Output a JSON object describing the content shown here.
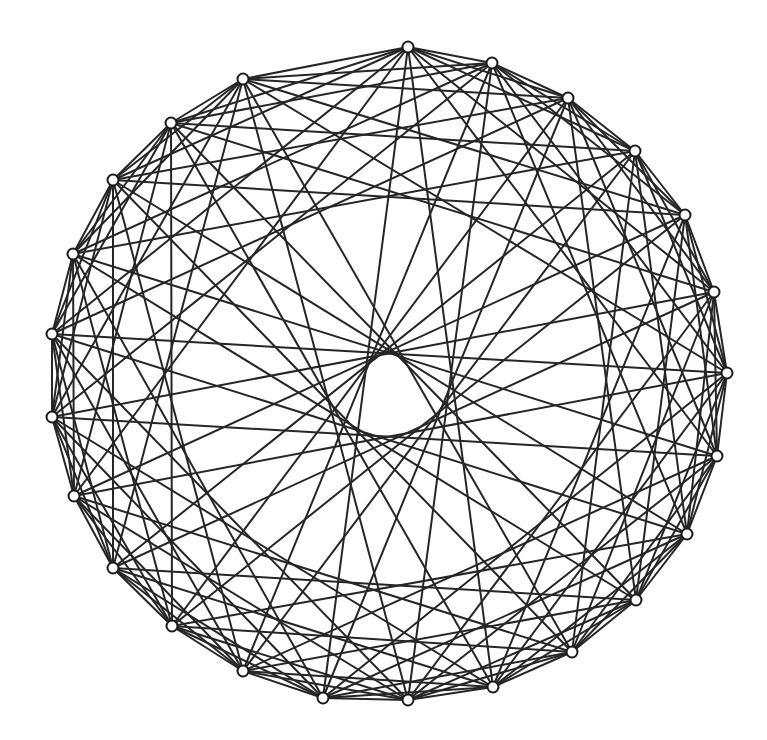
{
  "figure": {
    "kind": "circulant-graph-diagram",
    "title": "",
    "width": 767,
    "height": 740,
    "background_color": "#ffffff",
    "edge_color": "#262626",
    "edge_width": 2.0,
    "node_fill_color": "#ffffff",
    "node_stroke_color": "#1a1a1a",
    "node_stroke_width": 2.0,
    "node_radius": 5.5
  },
  "chart_data": {
    "type": "scatter",
    "title": "",
    "subtitle": "",
    "xlabel": "",
    "ylabel": "",
    "legend": [],
    "grid": false,
    "xlim": [
      0,
      767
    ],
    "ylim": [
      0,
      740
    ],
    "layout": "circular",
    "node_count": 24,
    "center": [
      390,
      375
    ],
    "radius_x": 338,
    "radius_y": 328,
    "inner_hole_radius": 22,
    "connection_offsets": [
      1,
      2,
      3,
      5,
      7,
      11
    ],
    "nodes": [
      {
        "id": 0,
        "label": "n0",
        "x": 408,
        "y": 47
      },
      {
        "id": 1,
        "label": "n1",
        "x": 492,
        "y": 63
      },
      {
        "id": 2,
        "label": "n2",
        "x": 568,
        "y": 98
      },
      {
        "id": 3,
        "label": "n3",
        "x": 635,
        "y": 151
      },
      {
        "id": 4,
        "label": "n4",
        "x": 685,
        "y": 215
      },
      {
        "id": 5,
        "label": "n5",
        "x": 714,
        "y": 292
      },
      {
        "id": 6,
        "label": "n6",
        "x": 727,
        "y": 373
      },
      {
        "id": 7,
        "label": "n7",
        "x": 717,
        "y": 456
      },
      {
        "id": 8,
        "label": "n8",
        "x": 687,
        "y": 534
      },
      {
        "id": 9,
        "label": "n9",
        "x": 636,
        "y": 600
      },
      {
        "id": 10,
        "label": "n10",
        "x": 572,
        "y": 652
      },
      {
        "id": 11,
        "label": "n11",
        "x": 493,
        "y": 687
      },
      {
        "id": 12,
        "label": "n12",
        "x": 408,
        "y": 700
      },
      {
        "id": 13,
        "label": "n13",
        "x": 323,
        "y": 698
      },
      {
        "id": 14,
        "label": "n14",
        "x": 243,
        "y": 671
      },
      {
        "id": 15,
        "label": "n15",
        "x": 172,
        "y": 626
      },
      {
        "id": 16,
        "label": "n16",
        "x": 113,
        "y": 568
      },
      {
        "id": 17,
        "label": "n17",
        "x": 74,
        "y": 496
      },
      {
        "id": 18,
        "label": "n18",
        "x": 52,
        "y": 417
      },
      {
        "id": 19,
        "label": "n19",
        "x": 52,
        "y": 334
      },
      {
        "id": 20,
        "label": "n20",
        "x": 73,
        "y": 254
      },
      {
        "id": 21,
        "label": "n21",
        "x": 113,
        "y": 180
      },
      {
        "id": 22,
        "label": "n22",
        "x": 171,
        "y": 123
      },
      {
        "id": 23,
        "label": "n23",
        "x": 243,
        "y": 79
      }
    ],
    "edges": [
      [
        0,
        1
      ],
      [
        1,
        2
      ],
      [
        2,
        3
      ],
      [
        3,
        4
      ],
      [
        4,
        5
      ],
      [
        5,
        6
      ],
      [
        6,
        7
      ],
      [
        7,
        8
      ],
      [
        8,
        9
      ],
      [
        9,
        10
      ],
      [
        10,
        11
      ],
      [
        11,
        12
      ],
      [
        12,
        13
      ],
      [
        13,
        14
      ],
      [
        14,
        15
      ],
      [
        15,
        16
      ],
      [
        16,
        17
      ],
      [
        17,
        18
      ],
      [
        18,
        19
      ],
      [
        19,
        20
      ],
      [
        20,
        21
      ],
      [
        21,
        22
      ],
      [
        22,
        23
      ],
      [
        23,
        0
      ],
      [
        0,
        2
      ],
      [
        1,
        3
      ],
      [
        2,
        4
      ],
      [
        3,
        5
      ],
      [
        4,
        6
      ],
      [
        5,
        7
      ],
      [
        6,
        8
      ],
      [
        7,
        9
      ],
      [
        8,
        10
      ],
      [
        9,
        11
      ],
      [
        10,
        12
      ],
      [
        11,
        13
      ],
      [
        12,
        14
      ],
      [
        13,
        15
      ],
      [
        14,
        16
      ],
      [
        15,
        17
      ],
      [
        16,
        18
      ],
      [
        17,
        19
      ],
      [
        18,
        20
      ],
      [
        19,
        21
      ],
      [
        20,
        22
      ],
      [
        21,
        23
      ],
      [
        22,
        0
      ],
      [
        23,
        1
      ],
      [
        0,
        3
      ],
      [
        1,
        4
      ],
      [
        2,
        5
      ],
      [
        3,
        6
      ],
      [
        4,
        7
      ],
      [
        5,
        8
      ],
      [
        6,
        9
      ],
      [
        7,
        10
      ],
      [
        8,
        11
      ],
      [
        9,
        12
      ],
      [
        10,
        13
      ],
      [
        11,
        14
      ],
      [
        12,
        15
      ],
      [
        13,
        16
      ],
      [
        14,
        17
      ],
      [
        15,
        18
      ],
      [
        16,
        19
      ],
      [
        17,
        20
      ],
      [
        18,
        21
      ],
      [
        19,
        22
      ],
      [
        20,
        23
      ],
      [
        21,
        0
      ],
      [
        22,
        1
      ],
      [
        23,
        2
      ],
      [
        0,
        5
      ],
      [
        1,
        6
      ],
      [
        2,
        7
      ],
      [
        3,
        8
      ],
      [
        4,
        9
      ],
      [
        5,
        10
      ],
      [
        6,
        11
      ],
      [
        7,
        12
      ],
      [
        8,
        13
      ],
      [
        9,
        14
      ],
      [
        10,
        15
      ],
      [
        11,
        16
      ],
      [
        12,
        17
      ],
      [
        13,
        18
      ],
      [
        14,
        19
      ],
      [
        15,
        20
      ],
      [
        16,
        21
      ],
      [
        17,
        22
      ],
      [
        18,
        23
      ],
      [
        19,
        0
      ],
      [
        20,
        1
      ],
      [
        21,
        2
      ],
      [
        22,
        3
      ],
      [
        23,
        4
      ],
      [
        0,
        7
      ],
      [
        1,
        8
      ],
      [
        2,
        9
      ],
      [
        3,
        10
      ],
      [
        4,
        11
      ],
      [
        5,
        12
      ],
      [
        6,
        13
      ],
      [
        7,
        14
      ],
      [
        8,
        15
      ],
      [
        9,
        16
      ],
      [
        10,
        17
      ],
      [
        11,
        18
      ],
      [
        12,
        19
      ],
      [
        13,
        20
      ],
      [
        14,
        21
      ],
      [
        15,
        22
      ],
      [
        16,
        23
      ],
      [
        17,
        0
      ],
      [
        18,
        1
      ],
      [
        19,
        2
      ],
      [
        20,
        3
      ],
      [
        21,
        4
      ],
      [
        22,
        5
      ],
      [
        23,
        6
      ],
      [
        0,
        11
      ],
      [
        1,
        12
      ],
      [
        2,
        13
      ],
      [
        3,
        14
      ],
      [
        4,
        15
      ],
      [
        5,
        16
      ],
      [
        6,
        17
      ],
      [
        7,
        18
      ],
      [
        8,
        19
      ],
      [
        9,
        20
      ],
      [
        10,
        21
      ],
      [
        11,
        22
      ],
      [
        12,
        23
      ],
      [
        13,
        0
      ],
      [
        14,
        1
      ],
      [
        15,
        2
      ],
      [
        16,
        3
      ],
      [
        17,
        4
      ],
      [
        18,
        5
      ],
      [
        19,
        6
      ],
      [
        20,
        7
      ],
      [
        21,
        8
      ],
      [
        22,
        9
      ],
      [
        23,
        10
      ]
    ]
  }
}
